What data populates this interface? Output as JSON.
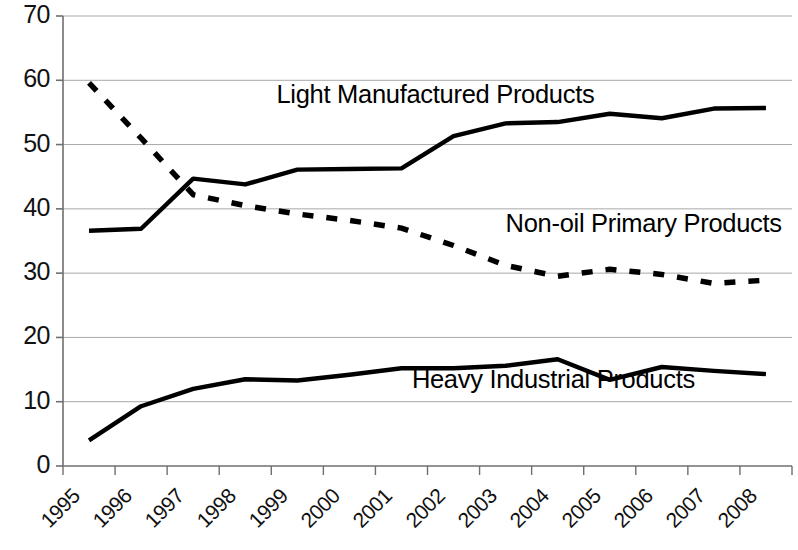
{
  "chart_data": {
    "type": "line",
    "title": "",
    "subtitle": "",
    "xlabel": "",
    "ylabel": "",
    "x": [
      "1995",
      "1996",
      "1997",
      "1998",
      "1999",
      "2000",
      "2001",
      "2002",
      "2003",
      "2004",
      "2005",
      "2006",
      "2007",
      "2008"
    ],
    "categories": [
      "1995",
      "1996",
      "1997",
      "1998",
      "1999",
      "2000",
      "2001",
      "2002",
      "2003",
      "2004",
      "2005",
      "2006",
      "2007",
      "2008"
    ],
    "xlim": [
      0,
      14
    ],
    "ylim": [
      0,
      70
    ],
    "yticks": [
      0,
      10,
      20,
      30,
      40,
      50,
      60,
      70
    ],
    "ytick_labels": [
      "0",
      "10",
      "20",
      "30",
      "40",
      "50",
      "60",
      "70"
    ],
    "grid": "horizontal",
    "legend": "inline-annotations",
    "series": [
      {
        "name": "Light Manufactured Products",
        "style": "solid",
        "color": "#000000",
        "values": [
          36.6,
          36.9,
          44.7,
          43.8,
          46.1,
          46.2,
          46.3,
          51.3,
          53.3,
          53.5,
          54.8,
          54.1,
          55.6,
          55.7
        ]
      },
      {
        "name": "Non-oil Primary Products",
        "style": "dashed",
        "color": "#000000",
        "values": [
          59.6,
          51.0,
          42.2,
          40.5,
          39.2,
          38.2,
          37.0,
          34.3,
          31.2,
          29.5,
          30.6,
          29.8,
          28.4,
          28.9
        ]
      },
      {
        "name": "Heavy Industrial Products",
        "style": "solid",
        "color": "#000000",
        "values": [
          4.0,
          9.3,
          12.0,
          13.5,
          13.3,
          14.2,
          15.2,
          15.2,
          15.6,
          16.6,
          13.4,
          15.4,
          14.8,
          14.3
        ]
      }
    ],
    "annotations": [
      {
        "text": "Light Manufactured Products",
        "x": 3.6,
        "y": 57.5
      },
      {
        "text": "Non-oil Primary Products",
        "x": 8.0,
        "y": 37.5
      },
      {
        "text": "Heavy Industrial Products",
        "x": 6.2,
        "y": 13.3
      }
    ]
  },
  "axes": {
    "y_labels": [
      "70",
      "60",
      "50",
      "40",
      "30",
      "20",
      "10",
      "0"
    ],
    "x_labels": [
      "1995",
      "1996",
      "1997",
      "1998",
      "1999",
      "2000",
      "2001",
      "2002",
      "2003",
      "2004",
      "2005",
      "2006",
      "2007",
      "2008"
    ]
  },
  "colors": {
    "line": "#000000",
    "grid": "#a8a8a8",
    "axis": "#6f6f6f",
    "background": "#ffffff"
  }
}
